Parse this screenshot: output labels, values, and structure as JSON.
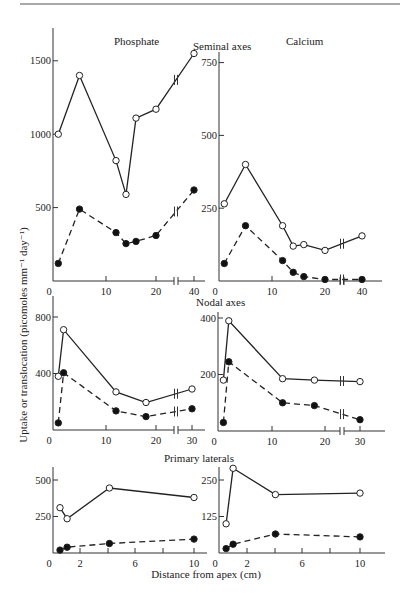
{
  "figure": {
    "top_rule": true,
    "ylabel": "Uptake or translocation (picomoles mm⁻¹ day⁻¹)",
    "xlabel": "Distance from apex (cm)",
    "column_titles": [
      "Phosphate",
      "Calcium"
    ],
    "row_titles": [
      "Seminal axes",
      "Nodal axes",
      "Primary laterals"
    ],
    "legend_note": "open circles (solid line) = uptake; filled circles (dashed line) = translocation"
  },
  "chart_data": [
    {
      "id": "phosphate-seminal",
      "type": "line",
      "title": "Phosphate",
      "row": "Seminal axes",
      "xlabel": "Distance from apex (cm)",
      "ylabel": "Uptake or translocation (picomoles mm-1 day-1)",
      "x_ticks": [
        "0",
        "10",
        "20",
        "40"
      ],
      "y_ticks": [
        "500",
        "1000",
        "1500"
      ],
      "ylim": [
        0,
        1600
      ],
      "axis_break_x": true,
      "series": [
        {
          "name": "uptake",
          "marker": "open-circle",
          "line": "solid",
          "x": [
            1,
            5,
            12,
            14,
            16,
            20,
            40
          ],
          "y": [
            1000,
            1400,
            820,
            590,
            1110,
            1170,
            1550
          ]
        },
        {
          "name": "translocation",
          "marker": "filled-circle",
          "line": "dashed",
          "x": [
            1,
            5,
            12,
            14,
            16,
            20,
            40
          ],
          "y": [
            120,
            490,
            330,
            255,
            270,
            310,
            620
          ]
        }
      ]
    },
    {
      "id": "calcium-seminal",
      "type": "line",
      "title": "Calcium",
      "row": "Seminal axes",
      "x_ticks": [
        "0",
        "10",
        "20",
        "40"
      ],
      "y_ticks": [
        "250",
        "500",
        "750"
      ],
      "ylim": [
        0,
        800
      ],
      "axis_break_x": true,
      "series": [
        {
          "name": "uptake",
          "marker": "open-circle",
          "line": "solid",
          "x": [
            1,
            5,
            12,
            14,
            16,
            20,
            40
          ],
          "y": [
            265,
            400,
            190,
            120,
            125,
            105,
            155
          ]
        },
        {
          "name": "translocation",
          "marker": "filled-circle",
          "line": "dashed",
          "x": [
            1,
            5,
            12,
            14,
            16,
            20,
            40
          ],
          "y": [
            60,
            190,
            70,
            30,
            15,
            5,
            5
          ]
        }
      ]
    },
    {
      "id": "phosphate-nodal",
      "type": "line",
      "title": "",
      "row": "Nodal axes",
      "x_ticks": [
        "0",
        "10",
        "20",
        "30"
      ],
      "y_ticks": [
        "400",
        "800"
      ],
      "ylim": [
        0,
        900
      ],
      "axis_break_x": true,
      "series": [
        {
          "name": "uptake",
          "marker": "open-circle",
          "line": "solid",
          "x": [
            1,
            2,
            12,
            18,
            30
          ],
          "y": [
            380,
            710,
            270,
            195,
            290
          ]
        },
        {
          "name": "translocation",
          "marker": "filled-circle",
          "line": "dashed",
          "x": [
            1,
            2,
            12,
            18,
            30
          ],
          "y": [
            50,
            405,
            135,
            95,
            150
          ]
        }
      ]
    },
    {
      "id": "calcium-nodal",
      "type": "line",
      "title": "",
      "row": "Nodal axes",
      "x_ticks": [
        "0",
        "10",
        "20",
        "30"
      ],
      "y_ticks": [
        "200",
        "400"
      ],
      "ylim": [
        0,
        450
      ],
      "axis_break_x": true,
      "series": [
        {
          "name": "uptake",
          "marker": "open-circle",
          "line": "solid",
          "x": [
            1,
            2,
            12,
            18,
            30
          ],
          "y": [
            180,
            390,
            185,
            180,
            175
          ]
        },
        {
          "name": "translocation",
          "marker": "filled-circle",
          "line": "dashed",
          "x": [
            1,
            2,
            12,
            18,
            30
          ],
          "y": [
            30,
            245,
            100,
            90,
            40
          ]
        }
      ]
    },
    {
      "id": "phosphate-laterals",
      "type": "line",
      "title": "",
      "row": "Primary laterals",
      "x_ticks": [
        "0",
        "2",
        "6",
        "10"
      ],
      "x_minor_ticks": [
        4,
        8
      ],
      "y_ticks": [
        "250",
        "500"
      ],
      "ylim": [
        0,
        650
      ],
      "axis_break_x": false,
      "series": [
        {
          "name": "uptake",
          "marker": "open-circle",
          "line": "solid",
          "x": [
            0.5,
            1,
            4,
            10
          ],
          "y": [
            310,
            235,
            445,
            380
          ]
        },
        {
          "name": "translocation",
          "marker": "filled-circle",
          "line": "dashed",
          "x": [
            0.5,
            1,
            4,
            10
          ],
          "y": [
            20,
            40,
            65,
            95
          ]
        }
      ]
    },
    {
      "id": "calcium-laterals",
      "type": "line",
      "title": "",
      "row": "Primary laterals",
      "x_ticks": [
        "0",
        "2",
        "6",
        "10"
      ],
      "x_minor_ticks": [
        4,
        8
      ],
      "y_ticks": [
        "125",
        "250"
      ],
      "ylim": [
        0,
        325
      ],
      "axis_break_x": false,
      "series": [
        {
          "name": "uptake",
          "marker": "open-circle",
          "line": "solid",
          "x": [
            0.5,
            1,
            4,
            10
          ],
          "y": [
            100,
            290,
            200,
            205
          ]
        },
        {
          "name": "translocation",
          "marker": "filled-circle",
          "line": "dashed",
          "x": [
            0.5,
            1,
            4,
            10
          ],
          "y": [
            15,
            30,
            65,
            55
          ]
        }
      ]
    }
  ]
}
